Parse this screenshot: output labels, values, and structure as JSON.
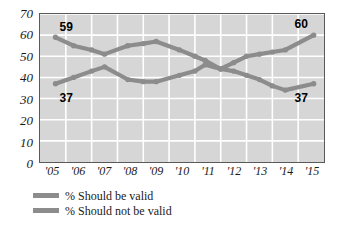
{
  "chart_data": {
    "type": "line",
    "title": "",
    "xlabel": "",
    "ylabel": "",
    "ylim": [
      0,
      70
    ],
    "yticks": [
      0,
      10,
      20,
      30,
      40,
      50,
      60,
      70
    ],
    "ytick_labels": [
      "0",
      "10",
      "20",
      "30",
      "40",
      "50",
      "60",
      "70"
    ],
    "categories": [
      "'05",
      "'06",
      "'07",
      "'08",
      "'09",
      "'10",
      "'11",
      "'12",
      "'13",
      "'14",
      "'15"
    ],
    "xlim": [
      2005,
      2016
    ],
    "grid": true,
    "legend_position": "below-left",
    "series": [
      {
        "name": "% Should not be valid",
        "color": "#8c8c8c",
        "x": [
          2005.6,
          2006.3,
          2007.0,
          2007.5,
          2008.4,
          2009.0,
          2009.5,
          2010.4,
          2011.0,
          2011.4,
          2012.0,
          2012.5,
          2013.0,
          2013.5,
          2014.0,
          2014.5,
          2015.6
        ],
        "values": [
          59,
          55,
          53,
          51,
          55,
          56,
          57,
          53,
          50,
          48,
          44,
          43,
          41,
          39,
          36,
          34,
          37
        ]
      },
      {
        "name": "% Should be valid",
        "color": "#8c8c8c",
        "x": [
          2005.6,
          2006.3,
          2007.0,
          2007.5,
          2008.4,
          2009.0,
          2009.5,
          2010.4,
          2011.0,
          2011.4,
          2012.0,
          2012.5,
          2013.0,
          2013.5,
          2014.0,
          2014.5,
          2015.6
        ],
        "values": [
          37,
          40,
          43,
          45,
          39,
          38,
          38,
          41,
          43,
          46,
          44,
          47,
          50,
          51,
          52,
          53,
          60
        ]
      }
    ],
    "annotations": [
      {
        "name": "start-not-valid",
        "text": "59",
        "x": 2005.6,
        "y": 59,
        "position": "above-right"
      },
      {
        "name": "end-valid",
        "text": "60",
        "x": 2015.6,
        "y": 60,
        "position": "above-left"
      },
      {
        "name": "start-valid",
        "text": "37",
        "x": 2005.6,
        "y": 37,
        "position": "below-right"
      },
      {
        "name": "end-not-valid",
        "text": "37",
        "x": 2015.6,
        "y": 37,
        "position": "below-left"
      }
    ]
  },
  "legend": {
    "items": [
      {
        "label": "% Should be valid",
        "color": "#8c8c8c"
      },
      {
        "label": "% Should not be valid",
        "color": "#8c8c8c"
      }
    ]
  },
  "style": {
    "plot_background": "#d6d6d6",
    "grid_color": "#ffffff",
    "frame_color": "#5a5a5a",
    "page_background": "#ffffff",
    "series_color_a": "#8c8c8c",
    "series_color_b": "#8c8c8c",
    "label_color": "#000000"
  }
}
